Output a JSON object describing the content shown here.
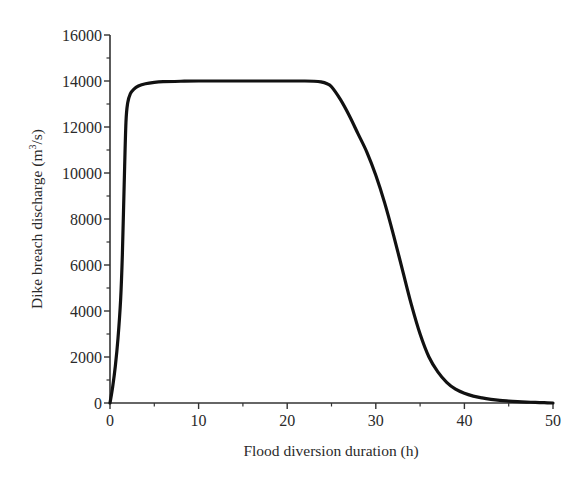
{
  "chart_data": {
    "type": "line",
    "title": "",
    "xlabel": "Flood diversion duration (h)",
    "ylabel": "Dike breach discharge (m",
    "ylabel_sup": "3",
    "ylabel_tail": "/s)",
    "xlim": [
      0,
      50
    ],
    "ylim": [
      0,
      16000
    ],
    "x_ticks": [
      0,
      10,
      20,
      30,
      40,
      50
    ],
    "x_tick_labels": [
      "0",
      "10",
      "20",
      "30",
      "40",
      "50"
    ],
    "y_ticks": [
      0,
      2000,
      4000,
      6000,
      8000,
      10000,
      12000,
      14000,
      16000
    ],
    "y_tick_labels": [
      "0",
      "2000",
      "4000",
      "6000",
      "8000",
      "10000",
      "12000",
      "14000",
      "16000"
    ],
    "grid": false,
    "legend": null,
    "series": [
      {
        "name": "Dike breach discharge",
        "color": "#111111",
        "x": [
          0,
          0.3,
          0.6,
          0.9,
          1.2,
          1.4,
          1.6,
          1.8,
          2.0,
          2.3,
          2.7,
          3.2,
          4.0,
          5.0,
          6.0,
          8.0,
          10,
          15,
          20,
          22,
          23,
          23.8,
          24.5,
          25,
          26,
          27,
          28,
          29,
          30,
          31,
          32,
          33,
          34,
          35,
          36,
          37,
          38,
          39,
          40,
          41,
          42,
          43,
          44,
          45,
          46,
          47,
          48,
          49,
          50
        ],
        "y": [
          0,
          700,
          1600,
          2800,
          4500,
          6500,
          9500,
          12200,
          13050,
          13450,
          13650,
          13780,
          13880,
          13940,
          13970,
          13990,
          14000,
          14000,
          14000,
          14000,
          13990,
          13960,
          13880,
          13750,
          13200,
          12500,
          11700,
          10900,
          9900,
          8700,
          7300,
          5800,
          4300,
          3000,
          2000,
          1350,
          900,
          600,
          420,
          300,
          220,
          160,
          115,
          85,
          60,
          40,
          25,
          12,
          0
        ]
      }
    ]
  }
}
